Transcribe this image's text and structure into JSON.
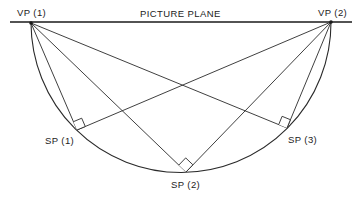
{
  "diagram": {
    "picture_plane": {
      "label": "PICTURE PLANE",
      "x1": 10,
      "x2": 352,
      "y": 22
    },
    "vanishing_points": [
      {
        "id": "vp1",
        "label": "VP (1)",
        "x": 31,
        "y": 23
      },
      {
        "id": "vp2",
        "label": "VP (2)",
        "x": 331,
        "y": 22
      }
    ],
    "station_points": [
      {
        "id": "sp1",
        "label": "SP (1)",
        "x": 77,
        "y": 130
      },
      {
        "id": "sp2",
        "label": "SP (2)",
        "x": 186,
        "y": 172
      },
      {
        "id": "sp3",
        "label": "SP (3)",
        "x": 287,
        "y": 128
      }
    ],
    "semicircle": {
      "cx": 181,
      "cy": 22,
      "r": 150
    },
    "colors": {
      "line": "#2a2a2a",
      "text": "#222222",
      "background": "#ffffff"
    }
  }
}
